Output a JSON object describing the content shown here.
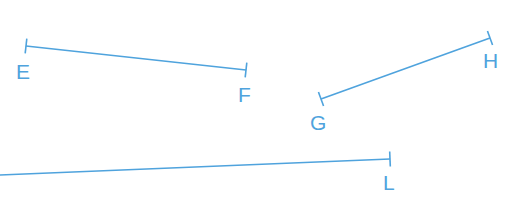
{
  "figure": {
    "width": 526,
    "height": 223,
    "background_color": "#ffffff",
    "stroke_color": "#4FA3DD",
    "label_color": "#4FA3DD",
    "stroke_width": 1.6,
    "tick_width": 1.6,
    "label_font_size": 21
  },
  "segments": [
    {
      "id": "EF",
      "name": "segment-ef",
      "start": {
        "label": "E",
        "x": 26,
        "y": 46,
        "tick": true
      },
      "end": {
        "label": "F",
        "x": 246,
        "y": 70,
        "tick": true
      },
      "labels": {
        "start": {
          "text": "E",
          "x": 16,
          "y": 79
        },
        "end": {
          "text": "F",
          "x": 238,
          "y": 102
        }
      }
    },
    {
      "id": "GH",
      "name": "segment-gh",
      "start": {
        "label": "G",
        "x": 321,
        "y": 99,
        "tick": true
      },
      "end": {
        "label": "H",
        "x": 490,
        "y": 38,
        "tick": true
      },
      "labels": {
        "start": {
          "text": "G",
          "x": 310,
          "y": 130
        },
        "end": {
          "text": "H",
          "x": 483,
          "y": 68
        }
      }
    },
    {
      "id": "L",
      "name": "segment-l",
      "start": {
        "label": "",
        "x": 0,
        "y": 175,
        "tick": false
      },
      "end": {
        "label": "L",
        "x": 390,
        "y": 159,
        "tick": true
      },
      "labels": {
        "start": {
          "text": "",
          "x": 0,
          "y": 0
        },
        "end": {
          "text": "L",
          "x": 383,
          "y": 190
        }
      }
    }
  ],
  "tick_geometry": {
    "half_length": 7.5,
    "description": "perpendicular end bar"
  }
}
